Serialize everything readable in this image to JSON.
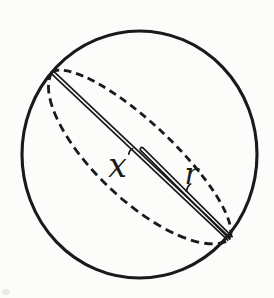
{
  "figure": {
    "labels": {
      "x": "x",
      "r": "r"
    },
    "colors": {
      "ink": "#1a1a1a",
      "paper": "#fcfcfa",
      "smudge": "#d9d9d4"
    }
  }
}
